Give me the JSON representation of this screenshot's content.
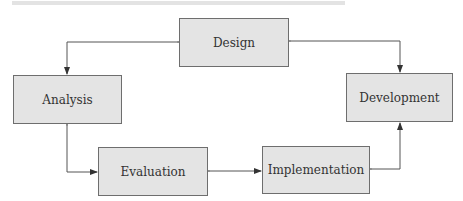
{
  "diagram": {
    "type": "cycle",
    "nodes": [
      {
        "id": "design",
        "label": "Design"
      },
      {
        "id": "analysis",
        "label": "Analysis"
      },
      {
        "id": "development",
        "label": "Development"
      },
      {
        "id": "evaluation",
        "label": "Evaluation"
      },
      {
        "id": "implementation",
        "label": "Implementation"
      }
    ],
    "edges": [
      {
        "from": "design",
        "to": "analysis",
        "bidirectional": true
      },
      {
        "from": "design",
        "to": "development",
        "bidirectional": true
      },
      {
        "from": "analysis",
        "to": "evaluation",
        "bidirectional": true
      },
      {
        "from": "evaluation",
        "to": "implementation",
        "bidirectional": true
      },
      {
        "from": "implementation",
        "to": "development",
        "bidirectional": true
      }
    ],
    "colors": {
      "node_fill": "#e4e4e4",
      "node_border": "#6e6e6e",
      "line": "#444444"
    }
  }
}
